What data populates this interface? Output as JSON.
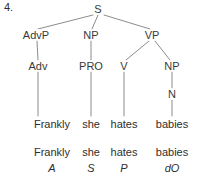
{
  "item": {
    "number": "4."
  },
  "tree": {
    "root": {
      "label": "S",
      "x": 98,
      "y": 9
    },
    "level2": [
      {
        "label": "AdvP",
        "x": 36,
        "y": 35
      },
      {
        "label": "NP",
        "x": 91,
        "y": 35
      },
      {
        "label": "VP",
        "x": 152,
        "y": 35
      }
    ],
    "level3": [
      {
        "label": "Adv",
        "x": 38,
        "y": 66
      },
      {
        "label": "PRO",
        "x": 91,
        "y": 66
      },
      {
        "label": "V",
        "x": 124,
        "y": 66
      },
      {
        "label": "NP",
        "x": 172,
        "y": 66
      }
    ],
    "level4": [
      {
        "label": "N",
        "x": 172,
        "y": 94
      }
    ]
  },
  "words": [
    {
      "text": "Frankly",
      "x": 52,
      "y": 124
    },
    {
      "text": "she",
      "x": 91,
      "y": 124
    },
    {
      "text": "hates",
      "x": 124,
      "y": 124
    },
    {
      "text": "babies",
      "x": 172,
      "y": 124
    }
  ],
  "gloss": [
    {
      "word": "Frankly",
      "function": "A",
      "x": 52,
      "word_y": 152,
      "func_y": 168
    },
    {
      "word": "she",
      "function": "S",
      "x": 91,
      "word_y": 152,
      "func_y": 168
    },
    {
      "word": "hates",
      "function": "P",
      "x": 124,
      "word_y": 152,
      "func_y": 168
    },
    {
      "word": "babies",
      "function": "dO",
      "x": 172,
      "word_y": 152,
      "func_y": 168
    }
  ],
  "edges": [
    {
      "from": "S",
      "to": "AdvP",
      "x1": 93,
      "y1": 15,
      "x2": 38,
      "y2": 29
    },
    {
      "from": "S",
      "to": "NP",
      "x1": 98,
      "y1": 15,
      "x2": 92,
      "y2": 29
    },
    {
      "from": "S",
      "to": "VP",
      "x1": 104,
      "y1": 15,
      "x2": 150,
      "y2": 29
    },
    {
      "from": "AdvP",
      "to": "Adv",
      "x1": 37,
      "y1": 41,
      "x2": 38,
      "y2": 60
    },
    {
      "from": "NP",
      "to": "PRO",
      "x1": 91,
      "y1": 41,
      "x2": 91,
      "y2": 60
    },
    {
      "from": "VP",
      "to": "V",
      "x1": 149,
      "y1": 41,
      "x2": 126,
      "y2": 60
    },
    {
      "from": "VP",
      "to": "NP2",
      "x1": 155,
      "y1": 41,
      "x2": 170,
      "y2": 60
    },
    {
      "from": "Adv",
      "to": "Frankly",
      "x1": 38,
      "y1": 72,
      "x2": 38,
      "y2": 116
    },
    {
      "from": "PRO",
      "to": "she",
      "x1": 91,
      "y1": 72,
      "x2": 91,
      "y2": 116
    },
    {
      "from": "V",
      "to": "hates",
      "x1": 124,
      "y1": 72,
      "x2": 124,
      "y2": 116
    },
    {
      "from": "NP2",
      "to": "N",
      "x1": 172,
      "y1": 72,
      "x2": 172,
      "y2": 88
    },
    {
      "from": "N",
      "to": "babies",
      "x1": 172,
      "y1": 100,
      "x2": 172,
      "y2": 116
    }
  ],
  "style": {
    "line_color": "#8c8c8c",
    "text_color": "#2e2e2e",
    "background": "#ffffff"
  }
}
